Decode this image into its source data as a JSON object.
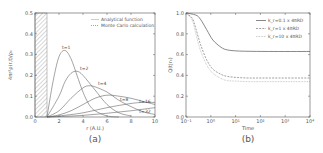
{
  "chart_data": [
    {
      "type": "line",
      "panel_caption": "(a)",
      "title": "",
      "xlabel": "r (A.U.)",
      "ylabel": "4πr²ρ(r,t)/ρ₀",
      "xlim": [
        0,
        10
      ],
      "ylim": [
        0,
        0.5
      ],
      "xticks": [
        "0",
        "2",
        "4",
        "6",
        "8",
        "10"
      ],
      "yticks": [
        "0.0",
        "0.1",
        "0.2",
        "0.3",
        "0.4",
        "0.5"
      ],
      "grid": false,
      "shaded_region": {
        "x": [
          0,
          1
        ],
        "pattern": "hatched"
      },
      "legend": {
        "position": "upper right",
        "entries": [
          "Analytical function",
          "Monte Carlo calculation"
        ]
      },
      "series": [
        {
          "name": "t=1",
          "x": [
            1,
            1.5,
            2,
            2.5,
            3,
            3.5,
            4,
            4.5,
            5,
            6,
            7
          ],
          "values": [
            0.0,
            0.17,
            0.29,
            0.32,
            0.28,
            0.2,
            0.12,
            0.06,
            0.03,
            0.005,
            0.0
          ]
        },
        {
          "name": "t=2",
          "x": [
            1,
            2,
            2.5,
            3,
            3.5,
            4,
            5,
            6,
            7,
            8
          ],
          "values": [
            0.0,
            0.1,
            0.17,
            0.21,
            0.22,
            0.2,
            0.13,
            0.06,
            0.02,
            0.005
          ]
        },
        {
          "name": "t=4",
          "x": [
            1,
            2,
            3,
            4,
            4.5,
            5,
            6,
            7,
            8,
            9,
            10
          ],
          "values": [
            0.0,
            0.03,
            0.09,
            0.14,
            0.15,
            0.145,
            0.12,
            0.08,
            0.05,
            0.025,
            0.012
          ]
        },
        {
          "name": "t=8",
          "x": [
            1,
            2,
            3,
            4,
            5,
            6,
            7,
            8,
            9,
            10
          ],
          "values": [
            0.0,
            0.01,
            0.03,
            0.06,
            0.09,
            0.105,
            0.1,
            0.09,
            0.075,
            0.06
          ]
        },
        {
          "name": "t=16",
          "x": [
            1,
            2,
            4,
            6,
            8,
            9,
            10
          ],
          "values": [
            0.0,
            0.005,
            0.02,
            0.045,
            0.065,
            0.07,
            0.07
          ]
        },
        {
          "name": "t=32",
          "x": [
            1,
            2,
            4,
            6,
            8,
            10
          ],
          "values": [
            0.0,
            0.002,
            0.008,
            0.018,
            0.03,
            0.045
          ]
        }
      ]
    },
    {
      "type": "line",
      "panel_caption": "(b)",
      "title": "",
      "xlabel": "Time",
      "ylabel": "Q(t|r₀)",
      "xscale": "log",
      "xlim": [
        0.1,
        100000
      ],
      "ylim": [
        0,
        1.0
      ],
      "xticks": [
        "10⁻¹",
        "10⁰",
        "10¹",
        "10²",
        "10³",
        "10⁴"
      ],
      "yticks": [
        "0.0",
        "0.2",
        "0.4",
        "0.6",
        "0.8",
        "1.0"
      ],
      "grid": false,
      "legend": {
        "position": "upper right",
        "entries": [
          "k_r=0.1 x 4πRD",
          "k_r=1 x 4πRD",
          "k_r=10 x 4πRD"
        ]
      },
      "series": [
        {
          "name": "k_r=0.1 x 4πRD",
          "style": "solid",
          "x": [
            0.1,
            0.3,
            0.5,
            1,
            2,
            5,
            10,
            30,
            100,
            1000,
            100000
          ],
          "values": [
            1.0,
            0.98,
            0.94,
            0.84,
            0.74,
            0.67,
            0.645,
            0.635,
            0.632,
            0.63,
            0.63
          ]
        },
        {
          "name": "k_r=1 x 4πRD",
          "style": "dashed",
          "x": [
            0.1,
            0.2,
            0.3,
            0.5,
            1,
            2,
            5,
            10,
            30,
            100,
            1000,
            100000
          ],
          "values": [
            1.0,
            0.95,
            0.85,
            0.7,
            0.55,
            0.46,
            0.41,
            0.39,
            0.38,
            0.375,
            0.375,
            0.375
          ]
        },
        {
          "name": "k_r=10 x 4πRD",
          "style": "dotted",
          "x": [
            0.1,
            0.2,
            0.3,
            0.5,
            1,
            2,
            5,
            10,
            30,
            100,
            1000,
            100000
          ],
          "values": [
            1.0,
            0.93,
            0.8,
            0.64,
            0.5,
            0.42,
            0.37,
            0.35,
            0.345,
            0.34,
            0.34,
            0.34
          ]
        }
      ]
    }
  ],
  "colors": {
    "axis": "#555555",
    "line": "#666666",
    "light_line": "#aaaaaa",
    "hatch": "#888888"
  }
}
